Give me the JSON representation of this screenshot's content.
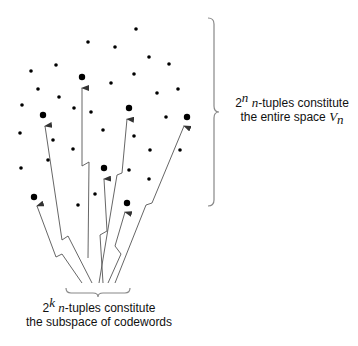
{
  "colors": {
    "dot": "#000000",
    "arrow": "#555555",
    "brace": "#888888",
    "text": "#111111"
  },
  "right_label": {
    "base": "2",
    "exponent": "n",
    "var": "n",
    "line1_rest": "-tuples constitute",
    "line2_prefix": "the entire space ",
    "space_symbol": "V",
    "space_sub": "n"
  },
  "bottom_label": {
    "base": "2",
    "exponent": "k",
    "var": "n",
    "line1_rest": "-tuples constitute",
    "line2": "the subspace of codewords"
  },
  "small_dots": [
    [
      136,
      29
    ],
    [
      88,
      42
    ],
    [
      115,
      47
    ],
    [
      149,
      57
    ],
    [
      56,
      65
    ],
    [
      169,
      64
    ],
    [
      31,
      71
    ],
    [
      134,
      74
    ],
    [
      111,
      83
    ],
    [
      38,
      89
    ],
    [
      178,
      89
    ],
    [
      157,
      93
    ],
    [
      59,
      97
    ],
    [
      22,
      105
    ],
    [
      74,
      108
    ],
    [
      91,
      112
    ],
    [
      166,
      117
    ],
    [
      103,
      130
    ],
    [
      20,
      133
    ],
    [
      134,
      136
    ],
    [
      53,
      140
    ],
    [
      73,
      149
    ],
    [
      150,
      150
    ],
    [
      180,
      150
    ],
    [
      48,
      160
    ],
    [
      21,
      168
    ],
    [
      129,
      170
    ],
    [
      149,
      179
    ],
    [
      95,
      194
    ],
    [
      78,
      205
    ]
  ],
  "codeword_dots": [
    [
      82,
      77
    ],
    [
      43,
      115
    ],
    [
      129,
      108
    ],
    [
      187,
      117
    ],
    [
      104,
      168
    ],
    [
      34,
      197
    ],
    [
      127,
      203
    ]
  ],
  "arrows": [
    {
      "target": "82,77",
      "points": "88,258 89,162 82,166 82,88"
    },
    {
      "target": "43,115",
      "points": "92,283 68,236 62,240 45,126"
    },
    {
      "target": "129,108",
      "points": "99,283 117,175 122,173 127,119"
    },
    {
      "target": "187,117",
      "points": "115,283 146,205 152,203 184,126"
    },
    {
      "target": "104,168",
      "points": "103,283 100,235 107,231 104,179"
    },
    {
      "target": "34,197",
      "points": "82,283 62,254 56,257 37,206"
    },
    {
      "target": "127,203",
      "points": "108,283 121,254 115,246 125,212"
    }
  ]
}
